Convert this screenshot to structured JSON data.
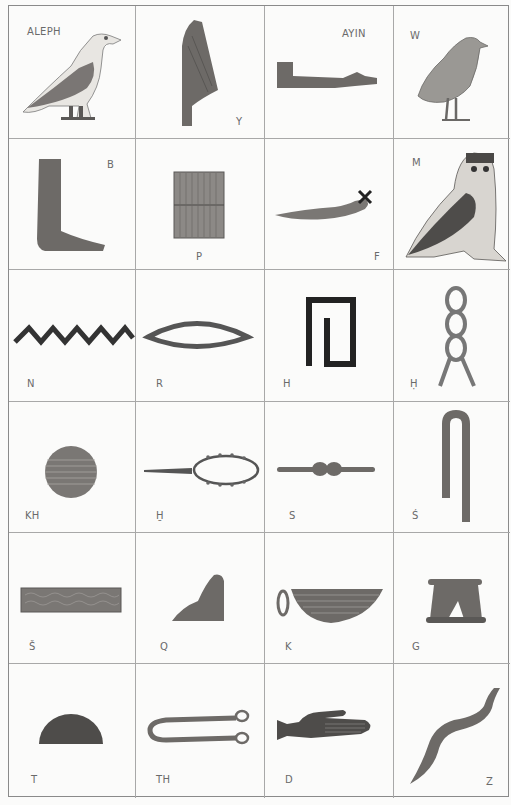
{
  "page": {
    "layout": {
      "columns": 4,
      "rows": 6
    }
  },
  "glyphs": [
    {
      "label": "ALEPH",
      "depicts": "vulture"
    },
    {
      "label": "Y",
      "depicts": "reed leaf"
    },
    {
      "label": "AYIN",
      "depicts": "forearm"
    },
    {
      "label": "W",
      "depicts": "quail chick"
    },
    {
      "label": "B",
      "depicts": "foot"
    },
    {
      "label": "P",
      "depicts": "stool"
    },
    {
      "label": "F",
      "depicts": "horned viper"
    },
    {
      "label": "M",
      "depicts": "owl"
    },
    {
      "label": "N",
      "depicts": "water"
    },
    {
      "label": "R",
      "depicts": "mouth"
    },
    {
      "label": "H",
      "depicts": "reed shelter"
    },
    {
      "label": "Ḥ",
      "depicts": "twisted wick"
    },
    {
      "label": "KH",
      "depicts": "placenta"
    },
    {
      "label": "H̱",
      "depicts": "animal belly"
    },
    {
      "label": "S",
      "depicts": "door bolt"
    },
    {
      "label": "Ś",
      "depicts": "folded cloth"
    },
    {
      "label": "Š",
      "depicts": "pool"
    },
    {
      "label": "Q",
      "depicts": "hill slope"
    },
    {
      "label": "K",
      "depicts": "basket with handle"
    },
    {
      "label": "G",
      "depicts": "jar stand"
    },
    {
      "label": "T",
      "depicts": "bread loaf"
    },
    {
      "label": "TH",
      "depicts": "tethering rope"
    },
    {
      "label": "D",
      "depicts": "hand"
    },
    {
      "label": "Z",
      "depicts": "cobra"
    }
  ]
}
